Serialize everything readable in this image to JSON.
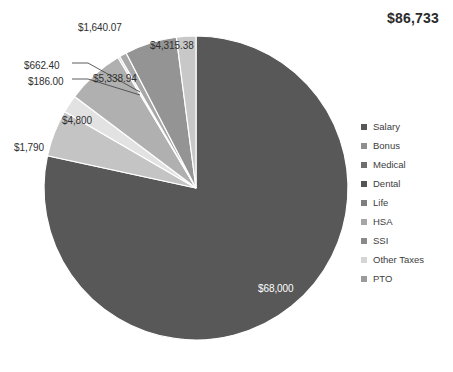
{
  "chart_data": {
    "type": "pie",
    "title": "$86,733",
    "total": 86733,
    "categories": [
      "Salary",
      "Bonus",
      "Medical",
      "Dental",
      "Life",
      "HSA",
      "SSI",
      "Other Taxes",
      "PTO"
    ],
    "values": [
      68000,
      1790,
      4800,
      662.4,
      186.0,
      5338.94,
      1640.07,
      4315.38,
      0
    ],
    "slices": [
      {
        "label": "Salary",
        "value": 68000,
        "display": "$68,000",
        "color": "#585858",
        "label_color": "#ffffff"
      },
      {
        "label": "PTO",
        "value": 4315.38,
        "display": "$4,315.38",
        "color": "#c4c4c4",
        "label_color": "#2f2f2f"
      },
      {
        "label": "Other Taxes",
        "value": 1640.07,
        "display": "$1,640.07",
        "color": "#e2e2e2",
        "label_color": "#2f2f2f"
      },
      {
        "label": "SSI",
        "value": 5338.94,
        "display": "$5,338.94",
        "color": "#b0b0b0",
        "label_color": "#2f2f2f"
      },
      {
        "label": "HSA",
        "value": 186.0,
        "display": "$186.00",
        "color": "#d8d8d8",
        "label_color": "#2f2f2f"
      },
      {
        "label": "Life",
        "value": 662.4,
        "display": "$662.40",
        "color": "#a8a8a8",
        "label_color": "#2f2f2f"
      },
      {
        "label": "Dental",
        "value": 4800,
        "display": "$4,800",
        "color": "#949494",
        "label_color": "#2f2f2f"
      },
      {
        "label": "Medical",
        "value": 1790,
        "display": "$1,790",
        "color": "#c8c8c8",
        "label_color": "#2f2f2f"
      },
      {
        "label": "Bonus",
        "value": 0,
        "display": "",
        "color": "#6e6e6e",
        "label_color": "#2f2f2f"
      }
    ],
    "legend": {
      "position": "right",
      "entries": [
        {
          "label": "Salary",
          "color": "#585858"
        },
        {
          "label": "Bonus",
          "color": "#8f8f8f"
        },
        {
          "label": "Medical",
          "color": "#6e6e6e"
        },
        {
          "label": "Dental",
          "color": "#555555"
        },
        {
          "label": "Life",
          "color": "#7e7e7e"
        },
        {
          "label": "HSA",
          "color": "#a6a6a6"
        },
        {
          "label": "SSI",
          "color": "#8a8a8a"
        },
        {
          "label": "Other Taxes",
          "color": "#d5d5d5"
        },
        {
          "label": "PTO",
          "color": "#9b9b9b"
        }
      ]
    },
    "data_labels": [
      {
        "text": "$1,640.07",
        "x": 78,
        "y": 22,
        "on_slice": false
      },
      {
        "text": "$4,315.38",
        "x": 150,
        "y": 40,
        "on_slice": false
      },
      {
        "text": "$662.40",
        "x": 24,
        "y": 60,
        "on_slice": false
      },
      {
        "text": "$186.00",
        "x": 28,
        "y": 76,
        "on_slice": false
      },
      {
        "text": "$5,338.94",
        "x": 93,
        "y": 73,
        "on_slice": false
      },
      {
        "text": "$4,800",
        "x": 62,
        "y": 115,
        "on_slice": false
      },
      {
        "text": "$1,790",
        "x": 14,
        "y": 142,
        "on_slice": false
      },
      {
        "text": "$68,000",
        "x": 258,
        "y": 283,
        "on_slice": true
      }
    ],
    "geometry": {
      "cx": 196,
      "cy": 188,
      "r": 152
    },
    "grid": false
  }
}
